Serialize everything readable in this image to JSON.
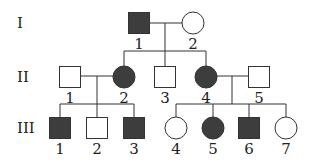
{
  "colors": {
    "affected_fill": "#3d3d3d",
    "unaffected_fill": "#ffffff",
    "outline": "#333333",
    "line": "#333333"
  },
  "generations": [
    {
      "label": "I",
      "y": 23
    },
    {
      "label": "II",
      "y": 77
    },
    {
      "label": "III",
      "y": 128
    }
  ],
  "individuals": [
    {
      "id": "I-1",
      "gen": "I",
      "num": "1",
      "sex": "male",
      "affected": true,
      "cx": 139,
      "cy": 23
    },
    {
      "id": "I-2",
      "gen": "I",
      "num": "2",
      "sex": "female",
      "affected": false,
      "cx": 193,
      "cy": 23
    },
    {
      "id": "II-1",
      "gen": "II",
      "num": "1",
      "sex": "male",
      "affected": false,
      "cx": 70,
      "cy": 77
    },
    {
      "id": "II-2",
      "gen": "II",
      "num": "2",
      "sex": "female",
      "affected": true,
      "cx": 124,
      "cy": 77
    },
    {
      "id": "II-3",
      "gen": "II",
      "num": "3",
      "sex": "male",
      "affected": false,
      "cx": 165,
      "cy": 77
    },
    {
      "id": "II-4",
      "gen": "II",
      "num": "4",
      "sex": "female",
      "affected": true,
      "cx": 206,
      "cy": 77
    },
    {
      "id": "II-5",
      "gen": "II",
      "num": "5",
      "sex": "male",
      "affected": false,
      "cx": 259,
      "cy": 77
    },
    {
      "id": "III-1",
      "gen": "III",
      "num": "1",
      "sex": "male",
      "affected": true,
      "cx": 60,
      "cy": 128
    },
    {
      "id": "III-2",
      "gen": "III",
      "num": "2",
      "sex": "male",
      "affected": false,
      "cx": 97,
      "cy": 128
    },
    {
      "id": "III-3",
      "gen": "III",
      "num": "3",
      "sex": "male",
      "affected": true,
      "cx": 134,
      "cy": 128
    },
    {
      "id": "III-4",
      "gen": "III",
      "num": "4",
      "sex": "female",
      "affected": false,
      "cx": 176,
      "cy": 128
    },
    {
      "id": "III-5",
      "gen": "III",
      "num": "5",
      "sex": "female",
      "affected": true,
      "cx": 213,
      "cy": 128
    },
    {
      "id": "III-6",
      "gen": "III",
      "num": "6",
      "sex": "male",
      "affected": true,
      "cx": 249,
      "cy": 128
    },
    {
      "id": "III-7",
      "gen": "III",
      "num": "7",
      "sex": "female",
      "affected": false,
      "cx": 286,
      "cy": 128
    }
  ],
  "matings": [
    {
      "partners": [
        "I-1",
        "I-2"
      ],
      "y": 23,
      "drop_x": 165,
      "sibship_y": 51,
      "children": [
        "II-2",
        "II-3",
        "II-4"
      ]
    },
    {
      "partners": [
        "II-1",
        "II-2"
      ],
      "y": 76,
      "drop_x": 97,
      "sibship_y": 104,
      "children": [
        "III-1",
        "III-2",
        "III-3"
      ]
    },
    {
      "partners": [
        "II-4",
        "II-5"
      ],
      "y": 76,
      "drop_x": 232,
      "sibship_y": 104,
      "children": [
        "III-4",
        "III-5",
        "III-6",
        "III-7"
      ]
    }
  ]
}
